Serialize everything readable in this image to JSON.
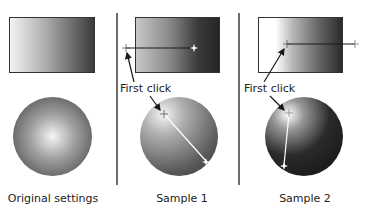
{
  "panels": [
    {
      "caption": "Original settings"
    },
    {
      "caption": "Sample 1",
      "callout": "First click"
    },
    {
      "caption": "Sample 2",
      "callout": "First click"
    }
  ],
  "colors": {
    "divider": "#6b6b6b",
    "gradient_light": "#f2f2f2",
    "gradient_dark": "#2e2e2e",
    "line": "#1a1a1a",
    "marker": "#ffffff"
  }
}
